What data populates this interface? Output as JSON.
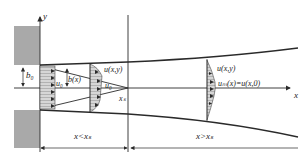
{
  "diagram": {
    "labels": {
      "y_axis": "y",
      "x_axis": "x",
      "b0": "b₀",
      "u0_left": "u₀",
      "b_x": "b(x)",
      "u_xy_1": "u(x,y)",
      "u0_tip": "u₀",
      "xs": "xₛ",
      "u_xy_2": "u(x,y)",
      "um": "uₘ(x)=u(x,0)",
      "region_initial": "x<xₛ",
      "region_main": "x>xₛ"
    },
    "colors": {
      "wall_fill": "#a9a9a9",
      "line": "#2a2a2a",
      "profile_fill": "#cfcfcf",
      "background": "#ffffff"
    }
  }
}
